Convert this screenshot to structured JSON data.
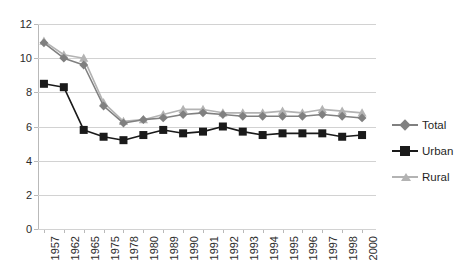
{
  "chart_data": {
    "type": "line",
    "title": "",
    "subtitle": "",
    "xlabel": "",
    "ylabel": "",
    "ylim": [
      0,
      12
    ],
    "yticks": [
      0,
      2,
      4,
      6,
      8,
      10,
      12
    ],
    "grid": true,
    "legend_position": "right",
    "categories": [
      "1957",
      "1962",
      "1965",
      "1975",
      "1978",
      "1980",
      "1989",
      "1990",
      "1991",
      "1992",
      "1993",
      "1994",
      "1995",
      "1996",
      "1997",
      "1998",
      "2000"
    ],
    "series": [
      {
        "name": "Total",
        "color": "#808080",
        "marker": "diamond",
        "values": [
          10.9,
          10.0,
          9.6,
          7.2,
          6.2,
          6.4,
          6.5,
          6.7,
          6.8,
          6.7,
          6.6,
          6.6,
          6.6,
          6.6,
          6.7,
          6.6,
          6.5
        ]
      },
      {
        "name": "Urban",
        "color": "#1a1a1a",
        "marker": "square",
        "values": [
          8.5,
          8.3,
          5.8,
          5.4,
          5.2,
          5.5,
          5.8,
          5.6,
          5.7,
          6.0,
          5.7,
          5.5,
          5.6,
          5.6,
          5.6,
          5.4,
          5.5
        ]
      },
      {
        "name": "Rural",
        "color": "#b3b3b3",
        "marker": "triangle",
        "values": [
          11.0,
          10.2,
          10.0,
          7.4,
          6.3,
          6.4,
          6.7,
          7.0,
          7.0,
          6.8,
          6.8,
          6.8,
          6.9,
          6.8,
          7.0,
          6.9,
          6.8
        ]
      }
    ]
  },
  "legend": {
    "items": [
      {
        "label": "Total"
      },
      {
        "label": "Urban"
      },
      {
        "label": "Rural"
      }
    ]
  },
  "axes": {
    "y_tick_labels": [
      "0",
      "2",
      "4",
      "6",
      "8",
      "10",
      "12"
    ],
    "x_tick_labels": [
      "1957",
      "1962",
      "1965",
      "1975",
      "1978",
      "1980",
      "1989",
      "1990",
      "1991",
      "1992",
      "1993",
      "1994",
      "1995",
      "1996",
      "1997",
      "1998",
      "2000"
    ]
  },
  "colors": {
    "total": "#808080",
    "urban": "#1a1a1a",
    "rural": "#b3b3b3",
    "grid": "#d2d2d2",
    "axis": "#b9b9b9",
    "text": "#2b2b2b",
    "background": "#ffffff"
  }
}
